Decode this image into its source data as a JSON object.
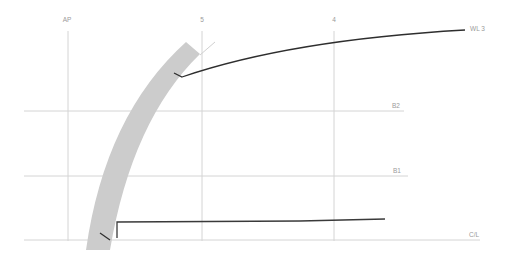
{
  "diagram": {
    "type": "lines-plan-section",
    "colors": {
      "grid": "#d4d4d4",
      "hull_band": "#cccccc",
      "profile": "#3a3a3a",
      "label": "#9a9a9a",
      "background": "#ffffff"
    },
    "stations": [
      {
        "label": "AP",
        "x": 68
      },
      {
        "label": "5",
        "x": 202
      },
      {
        "label": "4",
        "x": 334
      }
    ],
    "horizontals": [
      {
        "label": "B2",
        "y": 111,
        "x1": 24,
        "x2": 404
      },
      {
        "label": "B1",
        "y": 176,
        "x1": 24,
        "x2": 408
      },
      {
        "label": "C/L",
        "y": 240,
        "x1": 24,
        "x2": 480
      }
    ],
    "waterline": {
      "label": "WL 3"
    }
  }
}
